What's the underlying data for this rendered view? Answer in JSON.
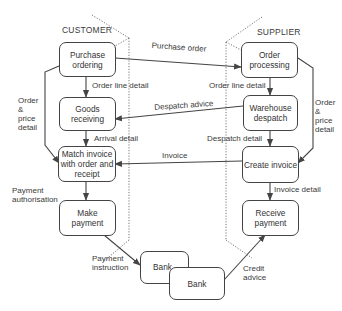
{
  "lanes": {
    "customer": "CUSTOMER",
    "supplier": "SUPPLIER"
  },
  "processes": {
    "purchase_ordering": "Purchase\nordering",
    "goods_receiving": "Goods\nreceiving",
    "match_invoice": "Match invoice\nwith order and\nreceipt",
    "make_payment": "Make\npayment",
    "order_processing": "Order\nprocessing",
    "warehouse_despatch": "Warehouse\ndespatch",
    "create_invoice": "Create invoice",
    "receive_payment": "Receive\npayment",
    "bank_customer": "Bank",
    "bank_supplier": "Bank"
  },
  "flows": {
    "purchase_order": "Purchase order",
    "order_line_detail_customer": "Order line detail",
    "order_line_detail_supplier": "Order line detail",
    "despatch_advice": "Despatch advice",
    "arrival_detail": "Arrival detail",
    "despatch_detail": "Despatch detail",
    "invoice": "Invoice",
    "invoice_detail": "Invoice detail",
    "order_price_detail_customer": "Order\n&\nprice\ndetail",
    "order_price_detail_supplier": "Order\n&\nprice\ndetail",
    "payment_authorisation": "Payment\nauthorisation",
    "payment_instruction": "Payment\ninstruction",
    "credit_advice": "Credit\nadvice"
  }
}
